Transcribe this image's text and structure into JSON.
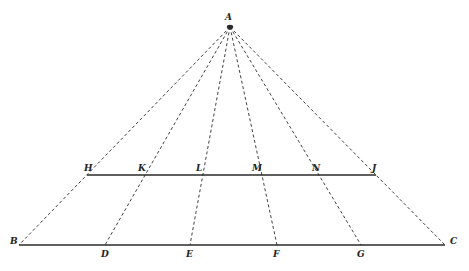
{
  "figure": {
    "stroke_color": "#2a2a2a",
    "background": "#ffffff",
    "apex": {
      "label": "A",
      "x": 230,
      "y": 27,
      "label_x": 225,
      "label_y": 20
    },
    "base_line": {
      "y": 245,
      "x1": 19,
      "x2": 445,
      "points": [
        {
          "label": "B",
          "x": 19,
          "label_x": 10,
          "label_y": 244
        },
        {
          "label": "D",
          "x": 105,
          "label_x": 101,
          "label_y": 257
        },
        {
          "label": "E",
          "x": 190,
          "label_x": 186,
          "label_y": 257
        },
        {
          "label": "F",
          "x": 277,
          "label_x": 273,
          "label_y": 257
        },
        {
          "label": "G",
          "x": 361,
          "label_x": 357,
          "label_y": 257
        },
        {
          "label": "C",
          "x": 445,
          "label_x": 450,
          "label_y": 244
        }
      ]
    },
    "mid_line": {
      "y": 175,
      "x1": 87,
      "x2": 376,
      "points": [
        {
          "label": "H",
          "x": 87,
          "label_x": 84,
          "label_y": 171
        },
        {
          "label": "K",
          "x": 142,
          "label_x": 138,
          "label_y": 171
        },
        {
          "label": "L",
          "x": 200,
          "label_x": 196,
          "label_y": 171
        },
        {
          "label": "M",
          "x": 258,
          "label_x": 252,
          "label_y": 171
        },
        {
          "label": "N",
          "x": 318,
          "label_x": 312,
          "label_y": 171
        },
        {
          "label": "J",
          "x": 376,
          "label_x": 372,
          "label_y": 171
        }
      ]
    }
  }
}
